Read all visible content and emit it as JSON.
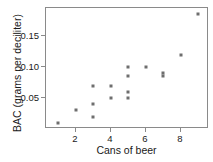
{
  "chart_data": {
    "type": "scatter",
    "title": "",
    "xlabel": "Cans of beer",
    "ylabel": "BAC (grams per deciliter)",
    "xlim": [
      0.3,
      9.6
    ],
    "ylim": [
      0.0,
      0.195
    ],
    "grid": false,
    "legend": null,
    "xticks": [
      2,
      4,
      6,
      8
    ],
    "xtick_labels": [
      "2",
      "4",
      "6",
      "8"
    ],
    "yticks": [
      0.05,
      0.1,
      0.15
    ],
    "ytick_labels": [
      "0.05",
      "0.10",
      "0.15"
    ],
    "marker": "square",
    "marker_color": "#6e6e6e",
    "axis_color": "#8a8a8a",
    "points": [
      {
        "x": 1,
        "y": 0.01
      },
      {
        "x": 2,
        "y": 0.03
      },
      {
        "x": 3,
        "y": 0.02
      },
      {
        "x": 3,
        "y": 0.04
      },
      {
        "x": 3,
        "y": 0.07
      },
      {
        "x": 4,
        "y": 0.05
      },
      {
        "x": 4,
        "y": 0.07
      },
      {
        "x": 5,
        "y": 0.05
      },
      {
        "x": 5,
        "y": 0.06
      },
      {
        "x": 5,
        "y": 0.085
      },
      {
        "x": 5,
        "y": 0.1
      },
      {
        "x": 6,
        "y": 0.1
      },
      {
        "x": 7,
        "y": 0.085
      },
      {
        "x": 7,
        "y": 0.09
      },
      {
        "x": 8,
        "y": 0.12
      },
      {
        "x": 9,
        "y": 0.185
      }
    ]
  }
}
